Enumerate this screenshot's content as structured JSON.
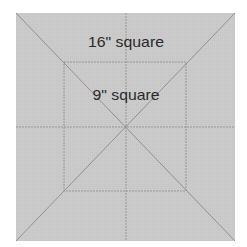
{
  "diagram": {
    "outer_label": "16\" square",
    "inner_label": "9\" square",
    "colors": {
      "fill": "#c9c9c9",
      "line": "#8a8a8a",
      "text": "#2a2a2a",
      "background": "#ffffff"
    }
  }
}
